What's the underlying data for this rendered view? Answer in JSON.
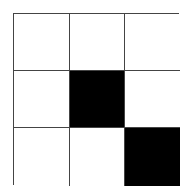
{
  "grid": {
    "rows": 3,
    "cols": 3,
    "fill_color": "#000000",
    "empty_color": "#ffffff",
    "line_color": "#444444",
    "cells": [
      [
        0,
        0,
        0
      ],
      [
        0,
        1,
        0
      ],
      [
        0,
        0,
        1
      ]
    ]
  }
}
